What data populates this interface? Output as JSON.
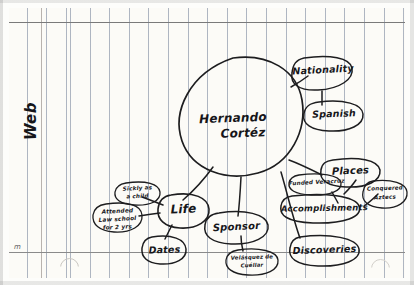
{
  "document": {
    "type": "handwritten-concept-web",
    "medium": "lined notebook paper",
    "page_label": "Web",
    "corner_mark": "m",
    "ink_color": "#1d1d1f",
    "paper_color": "#fcfbf7",
    "rule_color": "#6e7d96"
  },
  "center": {
    "line1": "Hernando",
    "line2": "Cortéz"
  },
  "nodes": {
    "nationality": "Nationality",
    "spanish": "Spanish",
    "places": "Places",
    "funded_veracruz": "Funded Veracruz",
    "conquered_aztecs_l1": "Conquered",
    "conquered_aztecs_l2": "Aztecs",
    "accomplishments": "Accomplishments",
    "discoveries": "Discoveries",
    "sponsor": "Sponsor",
    "velasquez_l1": "Velásquez de",
    "velasquez_l2": "Cuéllar",
    "life": "Life",
    "sickly_l1": "Sickly as",
    "sickly_l2": "a child",
    "attended_l1": "Attended",
    "attended_l2": "Law school",
    "attended_l3": "for 2 yrs",
    "dates": "Dates"
  }
}
